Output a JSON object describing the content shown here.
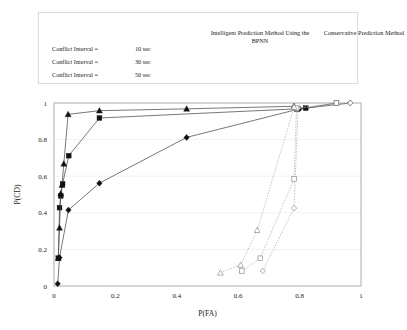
{
  "legend": {
    "headers": [
      {
        "id": "bpnn",
        "text": "Intelligent Prediction Method Using the BPNN"
      },
      {
        "id": "conservative",
        "text": "Conservative Prediction Method"
      }
    ],
    "rows": [
      {
        "label": "Conflict Interval =",
        "value": "10 sec",
        "marker": "diamond"
      },
      {
        "label": "Conflict Interval =",
        "value": "30 sec",
        "marker": "square"
      },
      {
        "label": "Conflict Interval =",
        "value": "50 sec",
        "marker": "triangle"
      }
    ]
  },
  "chart_data": {
    "type": "line",
    "title": "",
    "xlabel": "P(FA)",
    "ylabel": "P(CD)",
    "xlim": [
      0,
      1
    ],
    "ylim": [
      0,
      1
    ],
    "xticks": [
      0,
      0.2,
      0.4,
      0.6,
      0.8,
      1
    ],
    "xtick_labels": [
      "0",
      "0.2",
      "0.4",
      "0.6",
      "0.8",
      "1"
    ],
    "yticks": [
      0,
      0.2,
      0.4,
      0.6,
      0.8,
      1
    ],
    "ytick_labels": [
      "0",
      "0.2",
      "0.4",
      "0.6",
      "0.8",
      "1"
    ],
    "grid": "horizontal",
    "legend_position": "above-plot",
    "series": [
      {
        "name": "Intelligent Prediction Method Using the BPNN, Conflict Interval = 10 sec",
        "group": "Intelligent Prediction Method Using the BPNN",
        "conflict_interval": "10 sec",
        "marker": "diamond",
        "style": "solid",
        "x": [
          0.012,
          0.018,
          0.047,
          0.148,
          0.432,
          0.8,
          0.965
        ],
        "y": [
          0.012,
          0.155,
          0.415,
          0.562,
          0.812,
          0.968,
          1.0
        ]
      },
      {
        "name": "Intelligent Prediction Method Using the BPNN, Conflict Interval = 30 sec",
        "group": "Intelligent Prediction Method Using the BPNN",
        "conflict_interval": "30 sec",
        "marker": "square",
        "style": "solid",
        "x": [
          0.014,
          0.018,
          0.022,
          0.028,
          0.048,
          0.148,
          0.79,
          0.82,
          0.92
        ],
        "y": [
          0.152,
          0.428,
          0.492,
          0.558,
          0.712,
          0.918,
          0.968,
          0.972,
          1.0
        ]
      },
      {
        "name": "Intelligent Prediction Method Using the BPNN, Conflict Interval = 50 sec",
        "group": "Intelligent Prediction Method Using the BPNN",
        "conflict_interval": "50 sec",
        "marker": "triangle",
        "style": "solid",
        "x": [
          0.014,
          0.018,
          0.022,
          0.026,
          0.032,
          0.046,
          0.148,
          0.432,
          0.782
        ],
        "y": [
          0.152,
          0.318,
          0.505,
          0.552,
          0.668,
          0.938,
          0.958,
          0.968,
          0.982
        ]
      },
      {
        "name": "Conservative Prediction Method, Conflict Interval = 10 sec",
        "group": "Conservative Prediction Method",
        "conflict_interval": "10 sec",
        "marker": "diamond",
        "style": "dotted",
        "x": [
          0.68,
          0.782,
          0.795,
          0.965
        ],
        "y": [
          0.082,
          0.425,
          0.972,
          1.0
        ]
      },
      {
        "name": "Conservative Prediction Method, Conflict Interval = 30 sec",
        "group": "Conservative Prediction Method",
        "conflict_interval": "30 sec",
        "marker": "square",
        "style": "dotted",
        "x": [
          0.612,
          0.672,
          0.782,
          0.79,
          0.92
        ],
        "y": [
          0.082,
          0.152,
          0.585,
          0.972,
          1.0
        ]
      },
      {
        "name": "Conservative Prediction Method, Conflict Interval = 50 sec",
        "group": "Conservative Prediction Method",
        "conflict_interval": "50 sec",
        "marker": "triangle",
        "style": "dotted",
        "x": [
          0.542,
          0.608,
          0.662,
          0.782
        ],
        "y": [
          0.072,
          0.115,
          0.305,
          0.978
        ]
      }
    ]
  }
}
